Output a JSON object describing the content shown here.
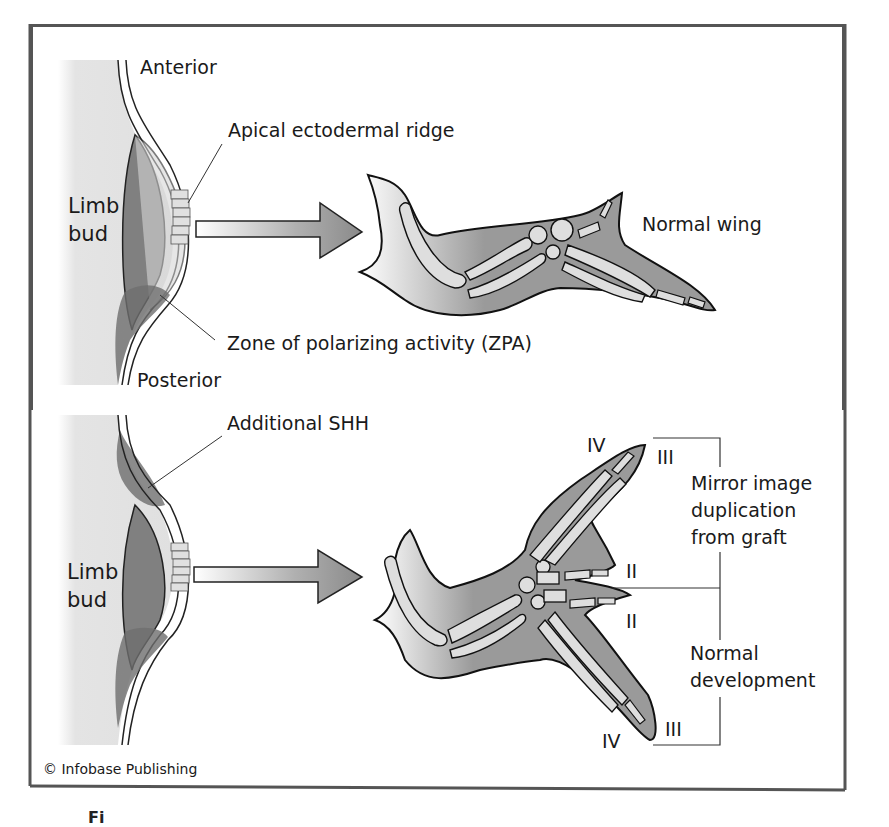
{
  "figure": {
    "top_panel": {
      "labels": {
        "anterior": "Anterior",
        "posterior": "Posterior",
        "limb_bud_line1": "Limb",
        "limb_bud_line2": "bud",
        "aer": "Apical ectodermal ridge",
        "zpa": "Zone of polarizing activity (ZPA)",
        "result": "Normal wing"
      }
    },
    "bottom_panel": {
      "labels": {
        "additional_shh": "Additional SHH",
        "limb_bud_line1": "Limb",
        "limb_bud_line2": "bud",
        "mirror_line1": "Mirror image",
        "mirror_line2": "duplication",
        "mirror_line3": "from graft",
        "normal_line1": "Normal",
        "normal_line2": "development"
      },
      "digits": {
        "top_left": "IV",
        "top_right": "III",
        "mid_upper": "II",
        "mid_lower": "II",
        "bottom_right": "III",
        "bottom_left": "IV"
      }
    },
    "copyright": "© Infobase Publishing",
    "caption_fragment": "Fi"
  },
  "colors": {
    "frame": "#555555",
    "tissue_gray": "#9a9a9a",
    "mesoderm_dark": "#7e7e7e",
    "bone_light": "#dcdcdc",
    "zpa_dark": "#6e6e6e",
    "limb_bud_bg": "#e6e6e6"
  }
}
